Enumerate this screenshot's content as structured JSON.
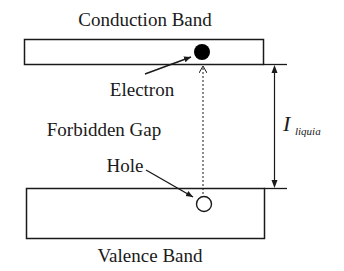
{
  "diagram": {
    "type": "energy-band-diagram",
    "labels": {
      "conduction_band": "Conduction Band",
      "valence_band": "Valence Band",
      "electron": "Electron",
      "hole": "Hole",
      "forbidden_gap": "Forbidden Gap",
      "gap_symbol": "I",
      "gap_subscript": "liquia"
    },
    "colors": {
      "stroke": "#1a1a1a",
      "background": "#ffffff",
      "electron_fill": "#000000",
      "hole_fill": "#ffffff"
    }
  }
}
